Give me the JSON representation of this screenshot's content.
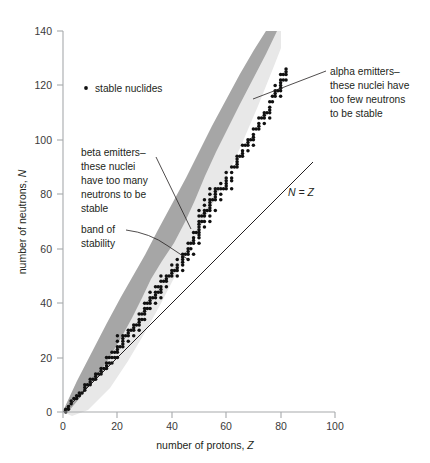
{
  "figure": {
    "background": "#ffffff",
    "width": 430,
    "height": 463
  },
  "chart_data": {
    "type": "scatter",
    "title": "",
    "xlabel": "number of protons, Z",
    "ylabel": "number of neutrons, N",
    "xlim": [
      0,
      100
    ],
    "ylim": [
      0,
      140
    ],
    "xticks": [
      0,
      20,
      40,
      60,
      80,
      100
    ],
    "yticks": [
      0,
      20,
      40,
      60,
      80,
      100,
      120,
      140
    ],
    "grid": false,
    "legend": {
      "position": "inside-upper-left",
      "entries": [
        {
          "marker": "dot",
          "label": "stable nuclides",
          "color": "#111111"
        }
      ]
    },
    "series": [
      {
        "name": "stable nuclides",
        "type": "scatter",
        "marker": "dot",
        "color": "#111111",
        "points": [
          [
            1,
            0
          ],
          [
            1,
            1
          ],
          [
            2,
            1
          ],
          [
            2,
            2
          ],
          [
            3,
            3
          ],
          [
            3,
            4
          ],
          [
            4,
            5
          ],
          [
            5,
            5
          ],
          [
            5,
            6
          ],
          [
            6,
            6
          ],
          [
            6,
            7
          ],
          [
            7,
            7
          ],
          [
            8,
            8
          ],
          [
            8,
            9
          ],
          [
            8,
            10
          ],
          [
            9,
            10
          ],
          [
            10,
            10
          ],
          [
            10,
            11
          ],
          [
            10,
            12
          ],
          [
            11,
            12
          ],
          [
            12,
            12
          ],
          [
            12,
            13
          ],
          [
            12,
            14
          ],
          [
            13,
            14
          ],
          [
            14,
            14
          ],
          [
            14,
            15
          ],
          [
            14,
            16
          ],
          [
            15,
            16
          ],
          [
            16,
            16
          ],
          [
            16,
            17
          ],
          [
            16,
            18
          ],
          [
            16,
            20
          ],
          [
            17,
            18
          ],
          [
            17,
            20
          ],
          [
            18,
            18
          ],
          [
            18,
            20
          ],
          [
            18,
            22
          ],
          [
            19,
            20
          ],
          [
            19,
            22
          ],
          [
            20,
            20
          ],
          [
            20,
            22
          ],
          [
            20,
            23
          ],
          [
            20,
            24
          ],
          [
            20,
            26
          ],
          [
            20,
            28
          ],
          [
            21,
            24
          ],
          [
            22,
            24
          ],
          [
            22,
            25
          ],
          [
            22,
            26
          ],
          [
            22,
            27
          ],
          [
            22,
            28
          ],
          [
            23,
            28
          ],
          [
            24,
            26
          ],
          [
            24,
            28
          ],
          [
            24,
            29
          ],
          [
            24,
            30
          ],
          [
            25,
            30
          ],
          [
            26,
            28
          ],
          [
            26,
            30
          ],
          [
            26,
            31
          ],
          [
            26,
            32
          ],
          [
            27,
            32
          ],
          [
            28,
            30
          ],
          [
            28,
            32
          ],
          [
            28,
            33
          ],
          [
            28,
            34
          ],
          [
            28,
            36
          ],
          [
            29,
            34
          ],
          [
            29,
            36
          ],
          [
            30,
            34
          ],
          [
            30,
            36
          ],
          [
            30,
            37
          ],
          [
            30,
            38
          ],
          [
            30,
            40
          ],
          [
            31,
            38
          ],
          [
            31,
            40
          ],
          [
            32,
            38
          ],
          [
            32,
            40
          ],
          [
            32,
            41
          ],
          [
            32,
            42
          ],
          [
            32,
            44
          ],
          [
            33,
            42
          ],
          [
            34,
            40
          ],
          [
            34,
            42
          ],
          [
            34,
            43
          ],
          [
            34,
            44
          ],
          [
            34,
            46
          ],
          [
            35,
            44
          ],
          [
            35,
            46
          ],
          [
            36,
            42
          ],
          [
            36,
            44
          ],
          [
            36,
            45
          ],
          [
            36,
            46
          ],
          [
            36,
            48
          ],
          [
            36,
            50
          ],
          [
            37,
            48
          ],
          [
            38,
            46
          ],
          [
            38,
            48
          ],
          [
            38,
            49
          ],
          [
            38,
            50
          ],
          [
            39,
            50
          ],
          [
            40,
            50
          ],
          [
            40,
            51
          ],
          [
            40,
            52
          ],
          [
            40,
            54
          ],
          [
            41,
            52
          ],
          [
            42,
            50
          ],
          [
            42,
            52
          ],
          [
            42,
            53
          ],
          [
            42,
            54
          ],
          [
            42,
            56
          ],
          [
            44,
            52
          ],
          [
            44,
            54
          ],
          [
            44,
            55
          ],
          [
            44,
            56
          ],
          [
            44,
            57
          ],
          [
            44,
            58
          ],
          [
            45,
            58
          ],
          [
            46,
            56
          ],
          [
            46,
            58
          ],
          [
            46,
            59
          ],
          [
            46,
            60
          ],
          [
            46,
            62
          ],
          [
            47,
            60
          ],
          [
            47,
            62
          ],
          [
            48,
            58
          ],
          [
            48,
            62
          ],
          [
            48,
            63
          ],
          [
            48,
            64
          ],
          [
            48,
            66
          ],
          [
            49,
            66
          ],
          [
            50,
            62
          ],
          [
            50,
            64
          ],
          [
            50,
            65
          ],
          [
            50,
            66
          ],
          [
            50,
            67
          ],
          [
            50,
            68
          ],
          [
            50,
            69
          ],
          [
            50,
            70
          ],
          [
            50,
            72
          ],
          [
            50,
            74
          ],
          [
            51,
            70
          ],
          [
            51,
            72
          ],
          [
            52,
            68
          ],
          [
            52,
            70
          ],
          [
            52,
            72
          ],
          [
            52,
            73
          ],
          [
            52,
            74
          ],
          [
            52,
            76
          ],
          [
            52,
            78
          ],
          [
            53,
            74
          ],
          [
            54,
            70
          ],
          [
            54,
            72
          ],
          [
            54,
            74
          ],
          [
            54,
            75
          ],
          [
            54,
            76
          ],
          [
            54,
            77
          ],
          [
            54,
            78
          ],
          [
            54,
            80
          ],
          [
            54,
            82
          ],
          [
            55,
            78
          ],
          [
            56,
            74
          ],
          [
            56,
            78
          ],
          [
            56,
            79
          ],
          [
            56,
            80
          ],
          [
            56,
            81
          ],
          [
            56,
            82
          ],
          [
            57,
            82
          ],
          [
            58,
            78
          ],
          [
            58,
            80
          ],
          [
            58,
            82
          ],
          [
            58,
            84
          ],
          [
            59,
            82
          ],
          [
            60,
            82
          ],
          [
            60,
            83
          ],
          [
            60,
            84
          ],
          [
            60,
            85
          ],
          [
            60,
            86
          ],
          [
            60,
            88
          ],
          [
            62,
            82
          ],
          [
            62,
            85
          ],
          [
            62,
            86
          ],
          [
            62,
            88
          ],
          [
            62,
            90
          ],
          [
            63,
            90
          ],
          [
            64,
            90
          ],
          [
            64,
            91
          ],
          [
            64,
            92
          ],
          [
            64,
            93
          ],
          [
            64,
            94
          ],
          [
            65,
            94
          ],
          [
            66,
            94
          ],
          [
            66,
            95
          ],
          [
            66,
            96
          ],
          [
            66,
            98
          ],
          [
            67,
            98
          ],
          [
            68,
            96
          ],
          [
            68,
            98
          ],
          [
            68,
            99
          ],
          [
            68,
            100
          ],
          [
            69,
            100
          ],
          [
            70,
            98
          ],
          [
            70,
            100
          ],
          [
            70,
            101
          ],
          [
            70,
            102
          ],
          [
            70,
            104
          ],
          [
            71,
            104
          ],
          [
            72,
            104
          ],
          [
            72,
            105
          ],
          [
            72,
            106
          ],
          [
            72,
            108
          ],
          [
            73,
            108
          ],
          [
            74,
            106
          ],
          [
            74,
            108
          ],
          [
            74,
            109
          ],
          [
            74,
            110
          ],
          [
            75,
            110
          ],
          [
            76,
            108
          ],
          [
            76,
            110
          ],
          [
            76,
            111
          ],
          [
            76,
            112
          ],
          [
            76,
            114
          ],
          [
            77,
            114
          ],
          [
            77,
            116
          ],
          [
            78,
            116
          ],
          [
            78,
            117
          ],
          [
            78,
            118
          ],
          [
            78,
            120
          ],
          [
            79,
            118
          ],
          [
            80,
            116
          ],
          [
            80,
            118
          ],
          [
            80,
            119
          ],
          [
            80,
            120
          ],
          [
            80,
            121
          ],
          [
            80,
            122
          ],
          [
            80,
            124
          ],
          [
            81,
            122
          ],
          [
            81,
            124
          ],
          [
            82,
            122
          ],
          [
            82,
            124
          ],
          [
            82,
            125
          ],
          [
            82,
            126
          ]
        ]
      }
    ],
    "bands": [
      {
        "name": "band of stability outer",
        "color": "#e8e8e8",
        "description": "light gray outer band enclosing known nuclides"
      },
      {
        "name": "band of stability inner",
        "color": "#a6a6a6",
        "description": "dark gray band along the upper (neutron-rich) edge"
      }
    ],
    "reference_lines": [
      {
        "name": "N = Z",
        "label": "N = Z",
        "from": [
          0,
          0
        ],
        "to": [
          93,
          93
        ],
        "color": "#231f20"
      }
    ],
    "annotations": [
      {
        "id": "beta-emitters",
        "lines": [
          "beta emitters–",
          "these nuclei",
          "have too many",
          "neutrons to be",
          "stable"
        ],
        "anchor": [
          44,
          62
        ]
      },
      {
        "id": "band-of-stability",
        "lines": [
          "band of",
          "stability"
        ],
        "anchor": [
          46,
          55
        ]
      },
      {
        "id": "alpha-emitters",
        "lines": [
          "alpha emitters–",
          "these nuclei have",
          "too few neutrons",
          "to be stable"
        ],
        "anchor": [
          73,
          112
        ]
      }
    ]
  },
  "axes": {
    "x": {
      "title_plain": "number of protons, ",
      "title_italic": "Z",
      "tick_labels": [
        "0",
        "20",
        "40",
        "60",
        "80",
        "100"
      ]
    },
    "y": {
      "title_plain": "number of neutrons, ",
      "title_italic": "N",
      "tick_labels": [
        "0",
        "20",
        "40",
        "60",
        "80",
        "100",
        "120",
        "140"
      ]
    }
  },
  "legend": {
    "label": "stable nuclides"
  },
  "annotations": {
    "beta": {
      "l1": "beta emitters–",
      "l2": "these nuclei",
      "l3": "have too many",
      "l4": "neutrons to be",
      "l5": "stable"
    },
    "band": {
      "l1": "band of",
      "l2": "stability"
    },
    "alpha": {
      "l1": "alpha emitters–",
      "l2": "these nuclei have",
      "l3": "too few neutrons",
      "l4": "to be stable"
    },
    "nz": {
      "label": "N = Z"
    }
  },
  "colors": {
    "dot": "#111111",
    "band_inner": "#a6a6a6",
    "band_outer": "#e8e8e8",
    "axis": "#a7a9ac",
    "text": "#231f20",
    "tick_text": "#3a3a3a"
  }
}
